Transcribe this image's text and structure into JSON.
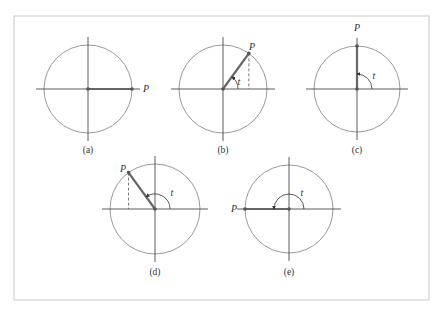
{
  "figure": {
    "frame": {
      "x": 14,
      "y": 16,
      "width": 415,
      "height": 284,
      "stroke": "#c8c8c8"
    },
    "colors": {
      "circle": "#9a9a9a",
      "axis": "#333333",
      "radius": "#666666",
      "point": "#555555",
      "dashed": "#555555",
      "text": "#333333"
    },
    "point_label": "P",
    "angle_label": "t",
    "panels": [
      {
        "id": "a",
        "caption": "(a)",
        "cx": 88,
        "cy": 89,
        "r": 44,
        "angle_deg": 0,
        "show_arc": false,
        "show_dashed": false,
        "p_label_pos": [
          146,
          92
        ],
        "caption_pos": [
          88,
          153
        ]
      },
      {
        "id": "b",
        "caption": "(b)",
        "cx": 223,
        "cy": 89,
        "r": 44,
        "angle_deg": 54,
        "show_arc": true,
        "arc_r": 15,
        "show_dashed": true,
        "p_label_pos": [
          252,
          50
        ],
        "t_label_pos": [
          239,
          85
        ],
        "caption_pos": [
          223,
          153
        ]
      },
      {
        "id": "c",
        "caption": "(c)",
        "cx": 357,
        "cy": 89,
        "r": 43,
        "angle_deg": 90,
        "show_arc": true,
        "arc_r": 15,
        "show_dashed": false,
        "p_label_pos": [
          357,
          31
        ],
        "t_label_pos": [
          374,
          79
        ],
        "caption_pos": [
          357,
          153
        ]
      },
      {
        "id": "d",
        "caption": "(d)",
        "cx": 155,
        "cy": 209,
        "r": 45,
        "angle_deg": 126,
        "show_arc": true,
        "arc_r": 15,
        "show_dashed": true,
        "p_label_pos": [
          123,
          172
        ],
        "t_label_pos": [
          172,
          196
        ],
        "caption_pos": [
          155,
          275
        ]
      },
      {
        "id": "e",
        "caption": "(e)",
        "cx": 289,
        "cy": 209,
        "r": 44,
        "angle_deg": 180,
        "show_arc": true,
        "arc_r": 15,
        "show_dashed": false,
        "p_label_pos": [
          234,
          212
        ],
        "t_label_pos": [
          302,
          196
        ],
        "caption_pos": [
          289,
          275
        ]
      }
    ]
  }
}
